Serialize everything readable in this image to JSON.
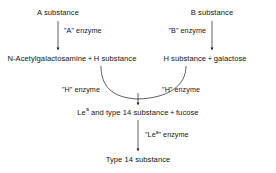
{
  "diagram": {
    "background_color": "#ffffff",
    "text_color": "#141414",
    "nodes": {
      "a_substance": "A substance",
      "b_substance": "B substance",
      "left_products_part1": "N-Acetylgalactosamine",
      "left_products_plus": "+",
      "left_products_part2": "H substance",
      "right_products_part1": "H substance",
      "right_products_plus": "+",
      "right_products_part2": "galactose",
      "lea_type14_pre": "Le",
      "lea_type14_sup": "a",
      "lea_type14_mid": " and type 14 substance",
      "lea_type14_plus": "+",
      "lea_type14_post": "fucose",
      "type14_substance": "Type 14 substance"
    },
    "edge_labels": {
      "a_enzyme": "\"A\" enzyme",
      "b_enzyme": "\"B\" enzyme",
      "h_enzyme_left": "\"H\" enzyme",
      "h_enzyme_right": "\"H\" enzyme",
      "lea_enzyme_pre": "\"Le",
      "lea_enzyme_sup": "a",
      "lea_enzyme_post": "\" enzyme"
    }
  }
}
